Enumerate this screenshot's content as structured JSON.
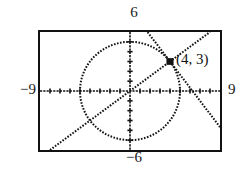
{
  "figure": {
    "kind": "graphing-calculator-screen",
    "point_label": "(4, 3)"
  },
  "window": {
    "ymax_label": "6",
    "ymin_label": "−6",
    "xmin_label": "−9",
    "xmax_label": "9"
  },
  "chart_data": {
    "type": "line",
    "title": "",
    "subtitle": "",
    "xlabel": "",
    "ylabel": "",
    "grid": false,
    "legend": "none",
    "xlim": [
      -9,
      9
    ],
    "ylim": [
      -6,
      6
    ],
    "xticks": [
      -8,
      -7,
      -6,
      -5,
      -4,
      -3,
      -2,
      -1,
      1,
      2,
      3,
      4,
      5,
      6,
      7,
      8
    ],
    "yticks": [
      -5,
      -4,
      -3,
      -2,
      -1,
      1,
      2,
      3,
      4,
      5
    ],
    "tick_style": "dotted-marks-on-axes",
    "axes": {
      "x_axis_y": 0,
      "y_axis_x": 0
    },
    "series": [
      {
        "name": "circle",
        "type": "implicit-circle",
        "equation": "x^2 + y^2 = 25",
        "center": [
          0,
          0
        ],
        "radius": 5,
        "style": "dotted"
      },
      {
        "name": "line-positive-slope",
        "type": "line",
        "equation": "y = 0.75x",
        "slope": 0.75,
        "intercept": 0,
        "points": [
          [
            -9,
            -6.75
          ],
          [
            4,
            3
          ],
          [
            9,
            6.75
          ]
        ],
        "style": "dotted"
      },
      {
        "name": "line-negative-slope",
        "type": "line",
        "equation": "y = -1.333x + 8.333",
        "slope": -1.3333,
        "intercept": 8.3333,
        "points": [
          [
            1.75,
            6
          ],
          [
            4,
            3
          ],
          [
            9,
            -3.67
          ]
        ],
        "style": "dotted"
      }
    ],
    "annotations": [
      {
        "name": "intersection-point",
        "x": 4,
        "y": 3,
        "label": "(4, 3)",
        "marker": "filled-square-dot"
      }
    ]
  },
  "colors": {
    "ink": "#121212",
    "screen_background": "#ffffff",
    "page_background": "#ffffff"
  }
}
